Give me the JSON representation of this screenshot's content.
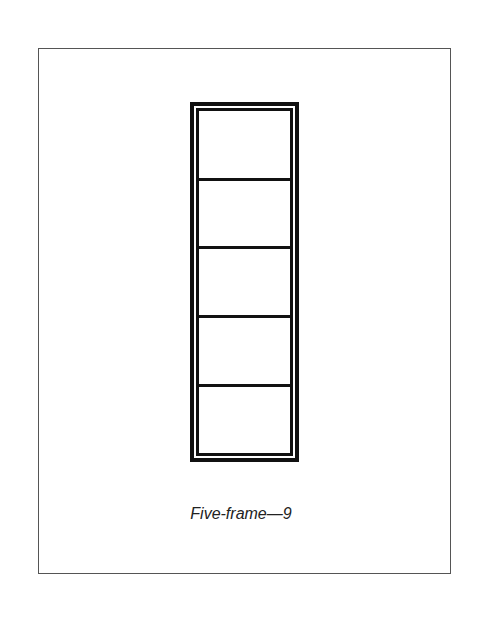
{
  "caption": "Five-frame—9",
  "diagram": {
    "type": "frame-with-panes",
    "pane_count": 5,
    "line_color": "#111111",
    "border_color": "#555555"
  }
}
